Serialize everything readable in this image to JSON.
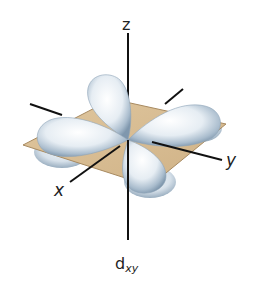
{
  "figure": {
    "type": "d-orbital-diagram",
    "orbital_label_main": "d",
    "orbital_label_sub": "xy",
    "axes": {
      "x_label": "x",
      "y_label": "y",
      "z_label": "z"
    },
    "colors": {
      "plane_fill": "#d8bd92",
      "plane_edge": "#a88a60",
      "lobe_light": "#ffffff",
      "lobe_mid": "#cfdbe6",
      "lobe_dark": "#7f97ad",
      "axis": "#111111"
    }
  }
}
